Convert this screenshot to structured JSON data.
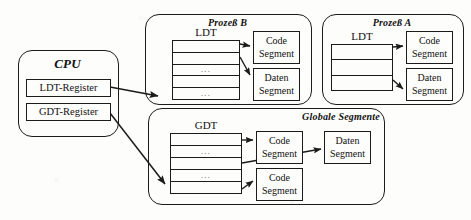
{
  "diagram": {
    "stroke_color": "#1b1b1b",
    "background_color": "#fdfdfb"
  },
  "cpu": {
    "title": "CPU",
    "registers": [
      {
        "label": "LDT-Register"
      },
      {
        "label": "GDT-Register"
      }
    ]
  },
  "prozess_b": {
    "title": "Prozeß B",
    "table_label": "LDT",
    "rows": [
      "",
      "",
      "...",
      "",
      "..."
    ],
    "segments": [
      {
        "line1": "Code",
        "line2": "Segment"
      },
      {
        "line1": "Daten",
        "line2": "Segment"
      }
    ]
  },
  "prozess_a": {
    "title": "Prozeß A",
    "table_label": "LDT",
    "rows": [
      "",
      "",
      ""
    ],
    "segments": [
      {
        "line1": "Code",
        "line2": "Segment"
      },
      {
        "line1": "Daten",
        "line2": "Segment"
      }
    ]
  },
  "globale_segmente": {
    "title": "Globale Segmente",
    "table_label": "GDT",
    "rows": [
      "",
      "...",
      "",
      "...",
      ""
    ],
    "segments": [
      {
        "line1": "Code",
        "line2": "Segment"
      },
      {
        "line1": "Code",
        "line2": "Segment"
      },
      {
        "line1": "Daten",
        "line2": "Segment"
      }
    ]
  }
}
